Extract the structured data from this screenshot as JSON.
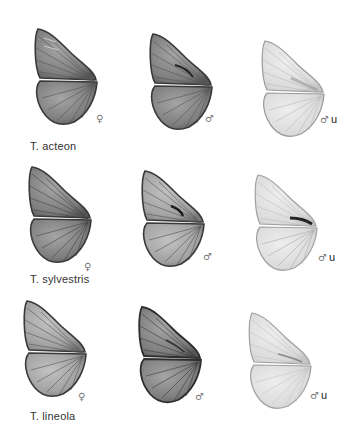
{
  "plate": {
    "rows": [
      {
        "species": "T. acteon",
        "specimens": [
          {
            "sex": "♀",
            "note": "",
            "view": "upperside",
            "tone": "dark"
          },
          {
            "sex": "♂",
            "note": "",
            "view": "upperside",
            "tone": "dark",
            "sex_brand": true
          },
          {
            "sex": "♂",
            "note": "u",
            "view": "underside",
            "tone": "light"
          }
        ]
      },
      {
        "species": "T. sylvestris",
        "specimens": [
          {
            "sex": "♀",
            "note": "",
            "view": "upperside",
            "tone": "dark"
          },
          {
            "sex": "♂",
            "note": "",
            "view": "upperside",
            "tone": "medium",
            "sex_brand": true
          },
          {
            "sex": "♂",
            "note": "u",
            "view": "underside",
            "tone": "light",
            "sex_brand": true
          }
        ]
      },
      {
        "species": "T. lineola",
        "specimens": [
          {
            "sex": "♀",
            "note": "",
            "view": "upperside",
            "tone": "medium"
          },
          {
            "sex": "♂",
            "note": "",
            "view": "upperside",
            "tone": "dark",
            "sex_brand": true
          },
          {
            "sex": "♂",
            "note": "u",
            "view": "underside",
            "tone": "light"
          }
        ]
      }
    ],
    "colors": {
      "dark_fill": "#8a8a8a",
      "dark_edge": "#3a3a3a",
      "medium_fill": "#a8a8a8",
      "light_fill": "#dcdcdc",
      "light_edge": "#9a9a9a",
      "label_text": "#333333"
    }
  }
}
